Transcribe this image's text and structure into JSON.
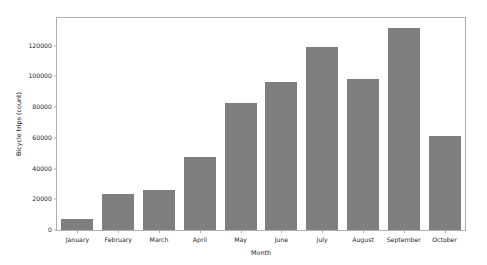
{
  "chart_data": {
    "type": "bar",
    "title": "",
    "xlabel": "Month",
    "ylabel": "Bicycle trips (count)",
    "categories": [
      "January",
      "February",
      "March",
      "April",
      "May",
      "June",
      "July",
      "August",
      "September",
      "October"
    ],
    "values": [
      7000,
      23500,
      26000,
      47500,
      82500,
      96500,
      119000,
      98000,
      131500,
      61500
    ],
    "ylim": [
      0,
      138000
    ],
    "yticks": [
      0,
      20000,
      40000,
      60000,
      80000,
      100000,
      120000
    ],
    "ytick_labels": [
      "0",
      "20000",
      "40000",
      "60000",
      "80000",
      "100000",
      "120000"
    ],
    "grid": false,
    "legend": null,
    "bar_color": "#7f7f7f",
    "axes_color": "#b0b0b0",
    "background_color": "#ffffff",
    "text_color": "#262626"
  }
}
